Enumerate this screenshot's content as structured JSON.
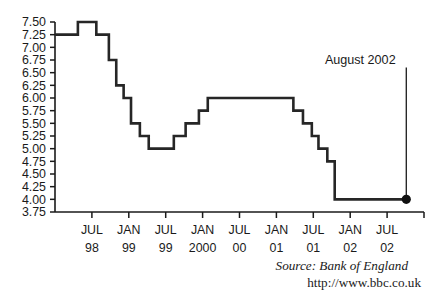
{
  "chart_data": {
    "type": "line",
    "title": "",
    "xlabel": "",
    "ylabel": "",
    "ylim": [
      3.75,
      7.5
    ],
    "ytick_values": [
      7.5,
      7.25,
      7.0,
      6.75,
      6.5,
      6.25,
      6.0,
      5.75,
      5.5,
      5.25,
      5.0,
      4.75,
      4.5,
      4.25,
      4.0,
      3.75
    ],
    "ytick_labels": [
      "7.50",
      "7.25",
      "7.00",
      "6.75",
      "6.50",
      "6.25",
      "6.00",
      "5.75",
      "5.50",
      "5.25",
      "5.00",
      "4.75",
      "4.50",
      "4.25",
      "4.00",
      "3.75"
    ],
    "grid": false,
    "legend": "none",
    "step_style": "post",
    "xtick_labels": [
      {
        "month": "JUL",
        "year": "98"
      },
      {
        "month": "JAN",
        "year": "99"
      },
      {
        "month": "JUL",
        "year": "99"
      },
      {
        "month": "JAN",
        "year": "2000"
      },
      {
        "month": "JUL",
        "year": "00"
      },
      {
        "month": "JAN",
        "year": "01"
      },
      {
        "month": "JUL",
        "year": "01"
      },
      {
        "month": "JAN",
        "year": "02"
      },
      {
        "month": "JUL",
        "year": "02"
      }
    ],
    "xlim": [
      0,
      10
    ],
    "series": [
      {
        "name": "UK base interest rate",
        "x": [
          0.0,
          0.62,
          1.12,
          1.46,
          1.66,
          1.86,
          2.06,
          2.3,
          2.54,
          2.84,
          3.22,
          3.54,
          3.9,
          4.14,
          4.4,
          4.76,
          6.46,
          6.72,
          6.96,
          7.14,
          7.38,
          7.58,
          7.76,
          9.52
        ],
        "values": [
          7.25,
          7.5,
          7.25,
          6.75,
          6.25,
          6.0,
          5.5,
          5.25,
          5.0,
          5.0,
          5.25,
          5.5,
          5.75,
          6.0,
          6.0,
          6.0,
          5.75,
          5.5,
          5.25,
          5.0,
          4.75,
          4.0,
          4.0,
          4.0
        ]
      }
    ],
    "endpoint": {
      "x": 9.52,
      "value": 4.0,
      "marker": "filled-circle"
    },
    "annotation": {
      "label": "August 2002",
      "pointer_x": 9.52,
      "pointer_top_value": 6.6,
      "pointer_bottom_value": 4.0
    }
  },
  "footer": {
    "source": "Source: Bank of England",
    "url": "http://www.bbc.co.uk"
  }
}
